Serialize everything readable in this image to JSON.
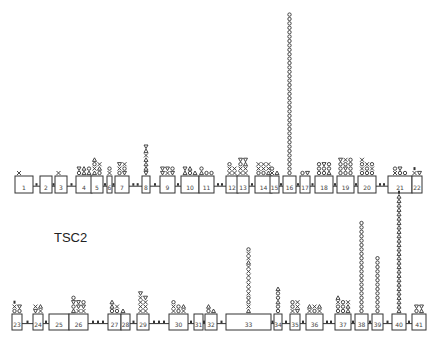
{
  "title": "TSC2",
  "legend_symbols": {
    "x": "cross",
    "o": "circle",
    "a": "triangle-up",
    "v": "triangle-down",
    "d": "small-bar"
  },
  "rows": [
    {
      "baseline_y": 178,
      "box_top": 176,
      "box_bottom": 193,
      "exons": [
        {
          "num": "1",
          "x": 15,
          "w": 18,
          "marks": [
            "x"
          ]
        },
        {
          "num": "2",
          "x": 40,
          "w": 12,
          "marks": []
        },
        {
          "num": "3",
          "x": 55,
          "w": 12,
          "marks": [
            "x"
          ]
        },
        {
          "num": "4",
          "x": 76,
          "w": 16,
          "marks": [
            "o",
            "a",
            "a",
            "v",
            "a",
            "o"
          ]
        },
        {
          "num": "5",
          "x": 91,
          "w": 12,
          "marks": [
            "a",
            "o",
            "x",
            "a",
            "o",
            "x",
            "a"
          ]
        },
        {
          "num": "6",
          "x": 107,
          "w": 5,
          "marks": [
            "x",
            "o"
          ]
        },
        {
          "num": "7",
          "x": 115,
          "w": 14,
          "marks": [
            "o",
            "v",
            "x",
            "o",
            "v",
            "x"
          ]
        },
        {
          "num": "8",
          "x": 142,
          "w": 8,
          "marks": [
            "v",
            "a",
            "a",
            "a",
            "x",
            "a",
            "v"
          ]
        },
        {
          "num": "9",
          "x": 160,
          "w": 15,
          "marks": [
            "v",
            "x",
            "v",
            "v",
            "v",
            "o"
          ]
        },
        {
          "num": "10",
          "x": 181,
          "w": 18,
          "marks": [
            "a",
            "o",
            "a",
            "v",
            "a"
          ]
        },
        {
          "num": "11",
          "x": 199,
          "w": 15,
          "marks": [
            "a",
            "o",
            "o",
            "o"
          ]
        },
        {
          "num": "12",
          "x": 226,
          "w": 12,
          "marks": [
            "x",
            "x",
            "x",
            "x",
            "o"
          ]
        },
        {
          "num": "13",
          "x": 237,
          "w": 12,
          "marks": [
            "x",
            "x",
            "x",
            "x",
            "o",
            "a",
            "v",
            "v"
          ]
        },
        {
          "num": "14",
          "x": 255,
          "w": 17,
          "marks": [
            "o",
            "o",
            "a",
            "x",
            "x",
            "x",
            "x",
            "x",
            "x"
          ]
        },
        {
          "num": "15",
          "x": 270,
          "w": 9,
          "marks": [
            "x",
            "a",
            "o"
          ]
        },
        {
          "num": "16",
          "x": 283,
          "w": 13,
          "marks": [
            "o",
            "o",
            "o",
            "o",
            "o",
            "o",
            "o",
            "o",
            "o",
            "o",
            "o",
            "o",
            "o",
            "o",
            "o",
            "o",
            "o",
            "o",
            "o",
            "o",
            "o",
            "o",
            "o",
            "o",
            "o",
            "o",
            "o",
            "o",
            "o",
            "o",
            "o",
            "o",
            "o",
            "o",
            "o",
            "o",
            "o"
          ]
        },
        {
          "num": "17",
          "x": 300,
          "w": 10,
          "marks": [
            "o",
            "v"
          ]
        },
        {
          "num": "18",
          "x": 315,
          "w": 18,
          "marks": [
            "o",
            "o",
            "a",
            "o",
            "o",
            "o",
            "o",
            "v",
            "o"
          ]
        },
        {
          "num": "19",
          "x": 337,
          "w": 17,
          "marks": [
            "o",
            "o",
            "o",
            "o",
            "v",
            "o",
            "o",
            "o",
            "o",
            "v",
            "x",
            "o"
          ]
        },
        {
          "num": "20",
          "x": 358,
          "w": 18,
          "marks": [
            "o",
            "o",
            "o",
            "x",
            "o",
            "x",
            "o",
            "x",
            "o",
            "x"
          ]
        },
        {
          "num": "21",
          "x": 388,
          "w": 24,
          "marks": [
            "x",
            "o",
            "o",
            "o",
            "v"
          ]
        },
        {
          "num": "22",
          "x": 412,
          "w": 10,
          "marks": [
            "x",
            "v",
            "d"
          ]
        }
      ]
    },
    {
      "baseline_y": 316,
      "box_top": 314,
      "box_bottom": 330,
      "exons": [
        {
          "num": "23",
          "x": 12,
          "w": 10,
          "marks": [
            "o",
            "o",
            "x",
            "v",
            "d"
          ]
        },
        {
          "num": "24",
          "x": 33,
          "w": 10,
          "marks": [
            "v",
            "x",
            "x",
            "a"
          ]
        },
        {
          "num": "25",
          "x": 49,
          "w": 20,
          "marks": []
        },
        {
          "num": "26",
          "x": 69,
          "w": 19,
          "marks": [
            "a",
            "x",
            "x",
            "o",
            "v",
            "v",
            "v",
            "v",
            "o",
            "o"
          ]
        },
        {
          "num": "27",
          "x": 108,
          "w": 13,
          "marks": [
            "o",
            "o",
            "a",
            "x",
            "a"
          ]
        },
        {
          "num": "28",
          "x": 121,
          "w": 9,
          "marks": [
            "a"
          ]
        },
        {
          "num": "29",
          "x": 137,
          "w": 12,
          "marks": [
            "x",
            "x",
            "x",
            "x",
            "x",
            "x",
            "x",
            "v",
            "v"
          ]
        },
        {
          "num": "30",
          "x": 169,
          "w": 19,
          "marks": [
            "x",
            "o",
            "x",
            "x",
            "o",
            "a",
            "o"
          ]
        },
        {
          "num": "31",
          "x": 194,
          "w": 9,
          "marks": []
        },
        {
          "num": "32",
          "x": 205,
          "w": 12,
          "marks": [
            "o",
            "a",
            "a"
          ]
        },
        {
          "num": "33",
          "x": 226,
          "w": 45,
          "marks": [
            "a",
            "x",
            "o",
            "o",
            "x",
            "x",
            "x",
            "x",
            "x",
            "x",
            "x",
            "a",
            "x",
            "x",
            "o"
          ]
        },
        {
          "num": "34",
          "x": 274,
          "w": 8,
          "marks": [
            "o",
            "o",
            "a",
            "o",
            "o",
            "a"
          ]
        },
        {
          "num": "35",
          "x": 290,
          "w": 10,
          "marks": [
            "x",
            "v",
            "o",
            "x",
            "o",
            "x"
          ]
        },
        {
          "num": "36",
          "x": 306,
          "w": 17,
          "marks": [
            "x",
            "o",
            "x",
            "a",
            "x",
            "a"
          ]
        },
        {
          "num": "37",
          "x": 335,
          "w": 16,
          "marks": [
            "o",
            "o",
            "a",
            "o",
            "o",
            "a",
            "x",
            "o",
            "x",
            "a"
          ]
        },
        {
          "num": "38",
          "x": 355,
          "w": 13,
          "marks": [
            "o",
            "o",
            "o",
            "o",
            "o",
            "o",
            "o",
            "o",
            "o",
            "o",
            "o",
            "o",
            "o",
            "o",
            "o",
            "o",
            "o",
            "o",
            "o",
            "o",
            "o"
          ]
        },
        {
          "num": "39",
          "x": 372,
          "w": 11,
          "marks": [
            "o",
            "o",
            "o",
            "o",
            "o",
            "o",
            "o",
            "o",
            "o",
            "o",
            "o",
            "o",
            "o"
          ]
        },
        {
          "num": "40",
          "x": 392,
          "w": 14,
          "marks": [
            "a",
            "a",
            "a",
            "a",
            "a",
            "a",
            "a",
            "a",
            "a",
            "a",
            "a",
            "a",
            "a",
            "a",
            "a",
            "a",
            "a",
            "a",
            "a",
            "a",
            "a",
            "a",
            "a",
            "a",
            "a",
            "a",
            "a",
            "d"
          ]
        },
        {
          "num": "41",
          "x": 412,
          "w": 14,
          "marks": [
            "o",
            "a",
            "v",
            "v"
          ]
        }
      ]
    }
  ]
}
